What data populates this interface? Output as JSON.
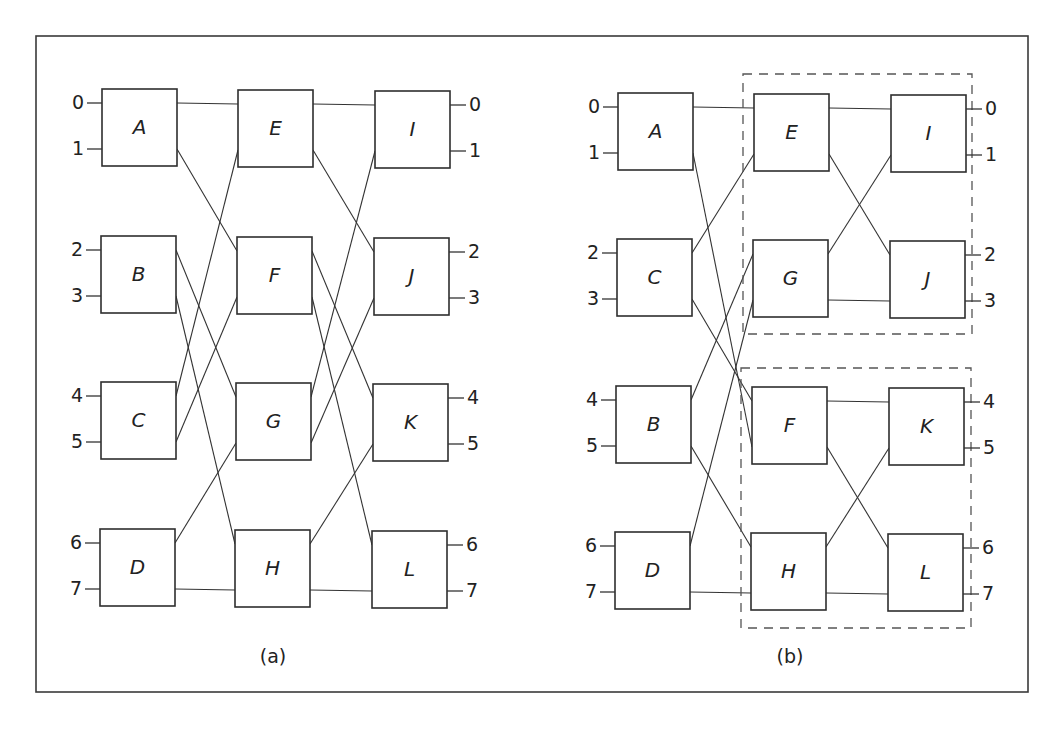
{
  "figure": {
    "panels": [
      {
        "id": "a",
        "caption": "(a)",
        "caption_pos": [
          273,
          657
        ],
        "nodes": [
          {
            "label": "A",
            "x": 102,
            "y": 89
          },
          {
            "label": "B",
            "x": 101,
            "y": 236
          },
          {
            "label": "C",
            "x": 101,
            "y": 382
          },
          {
            "label": "D",
            "x": 100,
            "y": 529
          },
          {
            "label": "E",
            "x": 238,
            "y": 90
          },
          {
            "label": "F",
            "x": 237,
            "y": 237
          },
          {
            "label": "G",
            "x": 236,
            "y": 383
          },
          {
            "label": "H",
            "x": 235,
            "y": 530
          },
          {
            "label": "I",
            "x": 375,
            "y": 91
          },
          {
            "label": "J",
            "x": 374,
            "y": 238
          },
          {
            "label": "K",
            "x": 373,
            "y": 384
          },
          {
            "label": "L",
            "x": 372,
            "y": 531
          }
        ],
        "inputs": [
          "0",
          "1",
          "2",
          "3",
          "4",
          "5",
          "6",
          "7"
        ],
        "outputs": [
          "0",
          "1",
          "2",
          "3",
          "4",
          "5",
          "6",
          "7"
        ],
        "connections": [
          [
            "A",
            0,
            "E",
            0
          ],
          [
            "A",
            1,
            "F",
            0
          ],
          [
            "B",
            0,
            "G",
            0
          ],
          [
            "B",
            1,
            "H",
            0
          ],
          [
            "C",
            0,
            "E",
            1
          ],
          [
            "C",
            1,
            "F",
            1
          ],
          [
            "D",
            0,
            "G",
            1
          ],
          [
            "D",
            1,
            "H",
            1
          ],
          [
            "E",
            0,
            "I",
            0
          ],
          [
            "E",
            1,
            "J",
            0
          ],
          [
            "F",
            0,
            "K",
            0
          ],
          [
            "F",
            1,
            "L",
            0
          ],
          [
            "G",
            0,
            "I",
            1
          ],
          [
            "G",
            1,
            "J",
            1
          ],
          [
            "H",
            0,
            "K",
            1
          ],
          [
            "H",
            1,
            "L",
            1
          ]
        ],
        "groups": []
      },
      {
        "id": "b",
        "caption": "(b)",
        "caption_pos": [
          790,
          657
        ],
        "nodes": [
          {
            "label": "A",
            "x": 618,
            "y": 93
          },
          {
            "label": "C",
            "x": 617,
            "y": 239
          },
          {
            "label": "B",
            "x": 616,
            "y": 386
          },
          {
            "label": "D",
            "x": 615,
            "y": 532
          },
          {
            "label": "E",
            "x": 754,
            "y": 94
          },
          {
            "label": "G",
            "x": 753,
            "y": 240
          },
          {
            "label": "F",
            "x": 752,
            "y": 387
          },
          {
            "label": "H",
            "x": 751,
            "y": 533
          },
          {
            "label": "I",
            "x": 891,
            "y": 95
          },
          {
            "label": "J",
            "x": 890,
            "y": 241
          },
          {
            "label": "K",
            "x": 889,
            "y": 388
          },
          {
            "label": "L",
            "x": 888,
            "y": 534
          }
        ],
        "inputs": [
          "0",
          "1",
          "2",
          "3",
          "4",
          "5",
          "6",
          "7"
        ],
        "outputs": [
          "0",
          "1",
          "2",
          "3",
          "4",
          "5",
          "6",
          "7"
        ],
        "connections": [
          [
            "A",
            0,
            "E",
            0
          ],
          [
            "A",
            1,
            "F",
            1
          ],
          [
            "C",
            0,
            "E",
            1
          ],
          [
            "C",
            1,
            "F",
            0
          ],
          [
            "B",
            0,
            "G",
            0
          ],
          [
            "B",
            1,
            "H",
            0
          ],
          [
            "D",
            0,
            "G",
            1
          ],
          [
            "D",
            1,
            "H",
            1
          ],
          [
            "E",
            0,
            "I",
            0
          ],
          [
            "E",
            1,
            "J",
            0
          ],
          [
            "G",
            0,
            "I",
            1
          ],
          [
            "G",
            1,
            "J",
            1
          ],
          [
            "F",
            0,
            "K",
            0
          ],
          [
            "F",
            1,
            "L",
            0
          ],
          [
            "H",
            0,
            "K",
            1
          ],
          [
            "H",
            1,
            "L",
            1
          ]
        ],
        "groups": [
          {
            "name": "upper-subnetwork",
            "x": 743,
            "y": 74,
            "w": 229,
            "h": 260
          },
          {
            "name": "lower-subnetwork",
            "x": 741,
            "y": 368,
            "w": 230,
            "h": 260
          }
        ]
      }
    ],
    "box_size": [
      75,
      77
    ],
    "port_offsets": [
      14,
      60
    ],
    "outer_frame": {
      "x": 36,
      "y": 36,
      "w": 992,
      "h": 656
    }
  }
}
